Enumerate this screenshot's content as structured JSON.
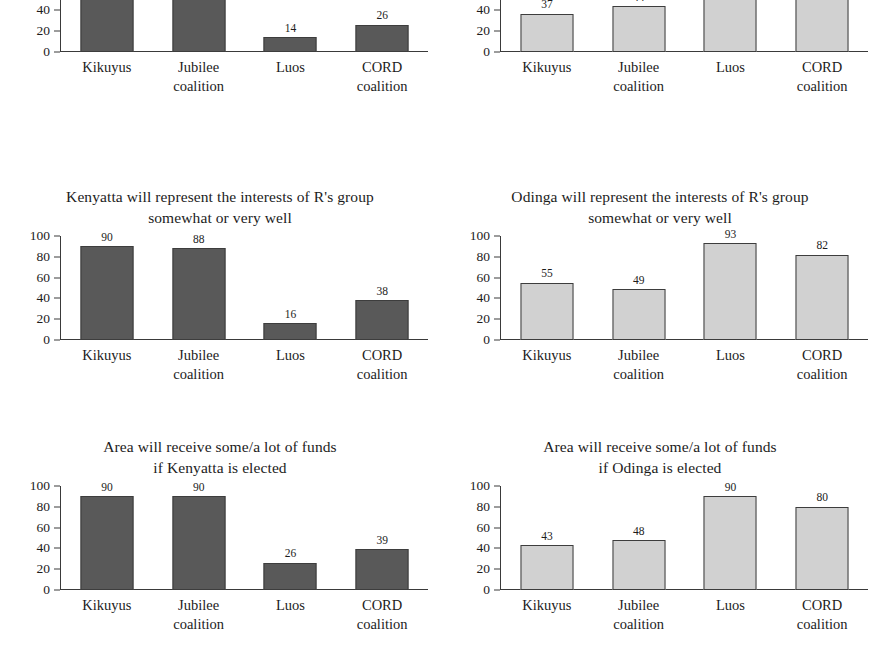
{
  "figure": {
    "background_color": "#ffffff",
    "bar_color_dark": "#595959",
    "bar_color_light": "#d1d1d1",
    "bar_border_color": "#3d3d3d",
    "axis_color": "#3a3a3a",
    "text_color": "#1c1c1c"
  },
  "chart_data": [
    {
      "id": "panel-top-left",
      "type": "bar",
      "title": "",
      "title_visible": false,
      "clipped_top": true,
      "categories": [
        "Kikuyus",
        "Jubilee\ncoalition",
        "Luos",
        "CORD\ncoalition"
      ],
      "values": [
        80,
        82,
        14,
        26
      ],
      "value_labels": [
        "80",
        "82",
        "14",
        "26"
      ],
      "series": [
        {
          "name": "Kenyatta",
          "values": [
            80,
            82,
            14,
            26
          ]
        }
      ],
      "bar_style": "dark",
      "xlabel": "",
      "ylabel": "",
      "ylim": [
        0,
        100
      ],
      "yticks": [
        0,
        20,
        40,
        60,
        80,
        100
      ],
      "ytick_labels_visible": [
        "80",
        "60",
        "40",
        "20",
        "0"
      ],
      "grid": false,
      "legend": false
    },
    {
      "id": "panel-top-right",
      "type": "bar",
      "title": "",
      "title_visible": false,
      "clipped_top": true,
      "categories": [
        "Kikuyus",
        "Jubilee\ncoalition",
        "Luos",
        "CORD\ncoalition"
      ],
      "values": [
        37,
        44,
        84,
        65
      ],
      "value_labels": [
        "37",
        "44",
        "84",
        "65"
      ],
      "series": [
        {
          "name": "Odinga",
          "values": [
            37,
            44,
            84,
            65
          ]
        }
      ],
      "bar_style": "light",
      "xlabel": "",
      "ylabel": "",
      "ylim": [
        0,
        100
      ],
      "yticks": [
        0,
        20,
        40,
        60,
        80,
        100
      ],
      "ytick_labels_visible": [
        "80",
        "60",
        "40",
        "20",
        "0"
      ],
      "grid": false,
      "legend": false
    },
    {
      "id": "panel-middle-left",
      "type": "bar",
      "title": "Kenyatta will represent the interests of R's group\nsomewhat or very well",
      "title_visible": true,
      "clipped_top": false,
      "categories": [
        "Kikuyus",
        "Jubilee\ncoalition",
        "Luos",
        "CORD\ncoalition"
      ],
      "values": [
        90,
        88,
        16,
        38
      ],
      "value_labels": [
        "90",
        "88",
        "16",
        "38"
      ],
      "series": [
        {
          "name": "Kenyatta",
          "values": [
            90,
            88,
            16,
            38
          ]
        }
      ],
      "bar_style": "dark",
      "xlabel": "",
      "ylabel": "",
      "ylim": [
        0,
        100
      ],
      "yticks": [
        0,
        20,
        40,
        60,
        80,
        100
      ],
      "ytick_labels_visible": [
        "100",
        "80",
        "60",
        "40",
        "20",
        "0"
      ],
      "grid": false,
      "legend": false
    },
    {
      "id": "panel-middle-right",
      "type": "bar",
      "title": "Odinga will represent the interests of R's group\nsomewhat or very well",
      "title_visible": true,
      "clipped_top": false,
      "categories": [
        "Kikuyus",
        "Jubilee\ncoalition",
        "Luos",
        "CORD\ncoalition"
      ],
      "values": [
        55,
        49,
        93,
        82
      ],
      "value_labels": [
        "55",
        "49",
        "93",
        "82"
      ],
      "series": [
        {
          "name": "Odinga",
          "values": [
            55,
            49,
            93,
            82
          ]
        }
      ],
      "bar_style": "light",
      "xlabel": "",
      "ylabel": "",
      "ylim": [
        0,
        100
      ],
      "yticks": [
        0,
        20,
        40,
        60,
        80,
        100
      ],
      "ytick_labels_visible": [
        "100",
        "80",
        "60",
        "40",
        "20",
        "0"
      ],
      "grid": false,
      "legend": false
    },
    {
      "id": "panel-bottom-left",
      "type": "bar",
      "title": "Area will receive some/a lot of funds\nif Kenyatta is elected",
      "title_visible": true,
      "clipped_top": false,
      "categories": [
        "Kikuyus",
        "Jubilee\ncoalition",
        "Luos",
        "CORD\ncoalition"
      ],
      "values": [
        90,
        90,
        26,
        39
      ],
      "value_labels": [
        "90",
        "90",
        "26",
        "39"
      ],
      "series": [
        {
          "name": "Kenyatta",
          "values": [
            90,
            90,
            26,
            39
          ]
        }
      ],
      "bar_style": "dark",
      "xlabel": "",
      "ylabel": "",
      "ylim": [
        0,
        100
      ],
      "yticks": [
        0,
        20,
        40,
        60,
        80,
        100
      ],
      "ytick_labels_visible": [
        "100",
        "80",
        "60",
        "40",
        "20",
        "0"
      ],
      "grid": false,
      "legend": false
    },
    {
      "id": "panel-bottom-right",
      "type": "bar",
      "title": "Area will receive some/a lot of funds\nif Odinga is elected",
      "title_visible": true,
      "clipped_top": false,
      "categories": [
        "Kikuyus",
        "Jubilee\ncoalition",
        "Luos",
        "CORD\ncoalition"
      ],
      "values": [
        43,
        48,
        90,
        80
      ],
      "value_labels": [
        "43",
        "48",
        "90",
        "80"
      ],
      "series": [
        {
          "name": "Odinga",
          "values": [
            43,
            48,
            90,
            80
          ]
        }
      ],
      "bar_style": "light",
      "xlabel": "",
      "ylabel": "",
      "ylim": [
        0,
        100
      ],
      "yticks": [
        0,
        20,
        40,
        60,
        80,
        100
      ],
      "ytick_labels_visible": [
        "100",
        "80",
        "60",
        "40",
        "20",
        "0"
      ],
      "grid": false,
      "legend": false
    }
  ],
  "layout": {
    "panel_positions": [
      {
        "id": "panel-top-left",
        "left": 0,
        "top": -56,
        "title_height": 0
      },
      {
        "id": "panel-top-right",
        "left": 440,
        "top": -56,
        "title_height": 0
      },
      {
        "id": "panel-middle-left",
        "left": 0,
        "top": 186,
        "title_height": 46
      },
      {
        "id": "panel-middle-right",
        "left": 440,
        "top": 186,
        "title_height": 46
      },
      {
        "id": "panel-bottom-left",
        "left": 0,
        "top": 436,
        "title_height": 46
      },
      {
        "id": "panel-bottom-right",
        "left": 440,
        "top": 436,
        "title_height": 46
      }
    ]
  }
}
